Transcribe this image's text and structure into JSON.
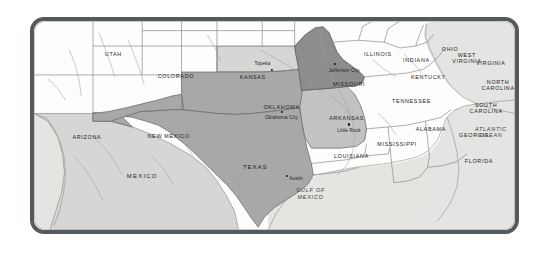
{
  "figure": {
    "kind": "reference-map",
    "frame_color": "#555a5c",
    "background_color": "#ffffff",
    "land_color": "#f3f3f1",
    "water_color": "#e4e4e2"
  },
  "legend_shades": {
    "dark": "#8d8d8d",
    "medium": "#a8a8a8",
    "light_medium": "#c3c3c3",
    "light": "#d6d6d4",
    "unshaded": "#fdfdfc"
  },
  "highlighted_states": [
    {
      "name": "MISSOURI",
      "shade": "dark"
    },
    {
      "name": "OKLAHOMA",
      "shade": "medium"
    },
    {
      "name": "TEXAS",
      "shade": "medium"
    },
    {
      "name": "ARKANSAS",
      "shade": "light_medium"
    },
    {
      "name": "KANSAS",
      "shade": "light"
    }
  ],
  "state_labels": [
    {
      "name": "UTAH",
      "x": 16.5,
      "y": 16.0,
      "size": "normal"
    },
    {
      "name": "COLORADO",
      "x": 29.5,
      "y": 26.5,
      "size": "normal"
    },
    {
      "name": "ARIZONA",
      "x": 11.0,
      "y": 55.5,
      "size": "normal"
    },
    {
      "name": "NEW MEXICO",
      "x": 28.0,
      "y": 55.0,
      "size": "normal"
    },
    {
      "name": "KANSAS",
      "x": 45.5,
      "y": 27.0,
      "size": "normal"
    },
    {
      "name": "OKLAHOMA",
      "x": 51.5,
      "y": 41.0,
      "size": "normal"
    },
    {
      "name": "MISSOURI",
      "x": 65.5,
      "y": 30.0,
      "size": "normal"
    },
    {
      "name": "ARKANSAS",
      "x": 65.0,
      "y": 46.5,
      "size": "normal"
    },
    {
      "name": "TEXAS",
      "x": 46.0,
      "y": 70.0,
      "size": "big"
    },
    {
      "name": "LOUISIANA",
      "x": 66.0,
      "y": 64.5,
      "size": "normal"
    },
    {
      "name": "MISSISSIPPI",
      "x": 75.5,
      "y": 59.0,
      "size": "normal"
    },
    {
      "name": "ALABAMA",
      "x": 82.5,
      "y": 51.5,
      "size": "normal"
    },
    {
      "name": "TENNESSEE",
      "x": 78.5,
      "y": 38.5,
      "size": "normal"
    },
    {
      "name": "KENTUCKY",
      "x": 82.0,
      "y": 27.0,
      "size": "normal"
    },
    {
      "name": "ILLINOIS",
      "x": 71.5,
      "y": 16.0,
      "size": "normal"
    },
    {
      "name": "INDIANA",
      "x": 79.5,
      "y": 18.5,
      "size": "normal"
    },
    {
      "name": "OHIO",
      "x": 86.5,
      "y": 13.5,
      "size": "normal"
    },
    {
      "name": "GEORGIA",
      "x": 91.5,
      "y": 54.5,
      "size": "normal"
    },
    {
      "name": "FLORIDA",
      "x": 92.5,
      "y": 67.0,
      "size": "normal"
    },
    {
      "name": "VIRGINIA",
      "x": 95.0,
      "y": 20.0,
      "size": "normal"
    }
  ],
  "state_labels_two_line": [
    {
      "line1": "WEST",
      "line2": "VIRGINIA",
      "x": 90.0,
      "y": 17.5
    },
    {
      "line1": "NORTH",
      "line2": "CAROLINA",
      "x": 96.5,
      "y": 30.5
    },
    {
      "line1": "SOUTH",
      "line2": "CAROLINA",
      "x": 94.0,
      "y": 41.5
    }
  ],
  "country_labels": [
    {
      "name": "MEXICO",
      "x": 22.5,
      "y": 74.0
    }
  ],
  "water_labels": [
    {
      "line1": "GULF OF",
      "line2": "MEXICO",
      "x": 57.5,
      "y": 82.5
    },
    {
      "line1": "ATLANTIC",
      "line2": "OCEAN",
      "x": 95.0,
      "y": 53.0
    }
  ],
  "cities": [
    {
      "name": "Topeka",
      "state": "KANSAS",
      "label_x": 47.5,
      "label_y": 20.0,
      "dot_x": 49.5,
      "dot_y": 23.5
    },
    {
      "name": "Jefferson City",
      "state": "MISSOURI",
      "label_x": 64.5,
      "label_y": 23.5,
      "dot_x": 62.5,
      "dot_y": 20.5
    },
    {
      "name": "Oklahoma City",
      "state": "OKLAHOMA",
      "label_x": 51.5,
      "label_y": 46.0,
      "dot_x": 51.5,
      "dot_y": 43.5
    },
    {
      "name": "Little Rock",
      "state": "ARKANSAS",
      "label_x": 65.5,
      "label_y": 52.0,
      "dot_x": 65.5,
      "dot_y": 49.5
    },
    {
      "name": "Austin",
      "state": "TEXAS",
      "label_x": 54.5,
      "label_y": 75.0,
      "dot_x": 52.5,
      "dot_y": 74.0
    }
  ]
}
